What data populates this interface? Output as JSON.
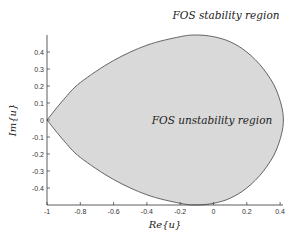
{
  "chart_data": {
    "type": "area",
    "title": "",
    "xlabel": "Re{u}",
    "ylabel": "Im{u}",
    "xlim": [
      -1,
      0.4
    ],
    "ylim": [
      -0.5,
      0.5
    ],
    "grid": false,
    "xticks": [
      -1,
      -0.8,
      -0.6,
      -0.4,
      -0.2,
      0,
      0.2,
      0.4
    ],
    "xtick_labels": [
      "-1",
      "-0.8",
      "-0.6",
      "-0.4",
      "-0.2",
      "0",
      "0.2",
      "0.4"
    ],
    "yticks": [
      0.4,
      0.3,
      0.2,
      0.1,
      0,
      -0.1,
      -0.2,
      -0.3,
      -0.4
    ],
    "ytick_labels": [
      "0.4",
      "0.3",
      "0.2",
      "0.1",
      "0",
      "-0.1",
      "-0.2",
      "-0.3",
      "-0.4"
    ],
    "annotations": [
      {
        "text": "FOS stability region",
        "x": -0.3,
        "y": 0.62,
        "location": "outside shaded region (above)"
      },
      {
        "text": "FOS unstability region",
        "x": -0.05,
        "y": 0.0,
        "location": "inside shaded region"
      }
    ],
    "series": [
      {
        "name": "FOS stability boundary",
        "fill": "#d9d9d9",
        "edge": "#555555",
        "boundary_upper": {
          "re": [
            -1.0,
            -0.9,
            -0.8,
            -0.6,
            -0.4,
            -0.2,
            -0.1,
            0.0,
            0.1,
            0.2,
            0.3,
            0.38,
            0.42
          ],
          "im": [
            0.0,
            0.12,
            0.22,
            0.35,
            0.44,
            0.49,
            0.5,
            0.49,
            0.46,
            0.4,
            0.3,
            0.17,
            0.0
          ]
        },
        "symmetric_about_real_axis": true
      }
    ]
  },
  "labels": {
    "stability": "FOS stability region",
    "unstability": "FOS unstability region",
    "xlabel": "Re{u}",
    "ylabel": "Im{u}"
  },
  "colors": {
    "region_fill": "#d9d9d9",
    "region_edge": "#555555",
    "axis": "#333333",
    "background": "#ffffff"
  }
}
